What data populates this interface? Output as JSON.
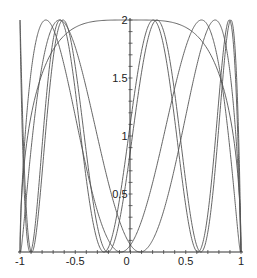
{
  "chart_data": {
    "type": "line",
    "title": "",
    "xlabel": "",
    "ylabel": "",
    "xlim": [
      -1,
      1
    ],
    "ylim": [
      0,
      2
    ],
    "grid": false,
    "legend": null,
    "x_ticks": [
      {
        "value": -1,
        "label": "-1"
      },
      {
        "value": -0.5,
        "label": "-0.5"
      },
      {
        "value": 0,
        "label": "0"
      },
      {
        "value": 0.5,
        "label": "0.5"
      },
      {
        "value": 1,
        "label": "1"
      }
    ],
    "y_ticks": [
      {
        "value": 0.5,
        "label": "0.5"
      },
      {
        "value": 1,
        "label": "1"
      },
      {
        "value": 1.5,
        "label": "1.5"
      },
      {
        "value": 2,
        "label": "2"
      }
    ],
    "envelope": {
      "points": [
        [
          -1,
          0
        ],
        [
          -0.95,
          0.95
        ],
        [
          -0.85,
          1.45
        ],
        [
          -0.7,
          1.75
        ],
        [
          -0.5,
          1.93
        ],
        [
          -0.3,
          1.99
        ],
        [
          0,
          2
        ],
        [
          0.3,
          1.99
        ],
        [
          0.5,
          1.93
        ],
        [
          0.7,
          1.75
        ],
        [
          0.85,
          1.45
        ],
        [
          0.95,
          0.95
        ],
        [
          1,
          0
        ]
      ]
    },
    "series": [
      {
        "name": "curve-1",
        "n": 7,
        "phase": 0.12
      },
      {
        "name": "curve-2",
        "n": 7,
        "phase": -0.12
      },
      {
        "name": "curve-3",
        "n": 4,
        "phase": 0.35
      },
      {
        "name": "curve-4",
        "n": 4,
        "phase": -0.35
      }
    ],
    "zeros_observed_x": [
      -1,
      -0.84,
      -0.73,
      -0.4,
      -0.08,
      0.07,
      0.4,
      0.73,
      0.83,
      1
    ]
  }
}
